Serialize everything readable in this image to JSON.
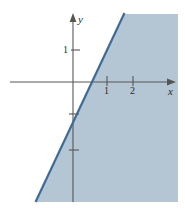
{
  "figure": {
    "name": "linear-inequality-graph",
    "background_color": "#ffffff",
    "shade_color": "#b4c6d4",
    "line_color": "#3c6c95",
    "axis_color": "#555555",
    "text_color": "#2b2b2b"
  },
  "axes": {
    "x_axis_label": "x",
    "y_axis_label": "y",
    "x_ticks": [
      {
        "label": "1",
        "value": 1
      },
      {
        "label": "2",
        "value": 2
      }
    ],
    "y_ticks": [
      {
        "label": "1",
        "value": 1
      },
      {
        "label": "",
        "value": -1
      },
      {
        "label": "",
        "value": -2
      }
    ],
    "origin_px": {
      "x": 73,
      "y": 82
    },
    "x_unit_px": 26,
    "y_unit_px": 32,
    "x_range": [
      -2.4,
      3.9
    ],
    "y_range": [
      -3.8,
      2.1
    ]
  },
  "chart_data": {
    "type": "line",
    "title": "",
    "xlabel": "x",
    "ylabel": "y",
    "xlim": [
      -2.4,
      3.9
    ],
    "ylim": [
      -3.8,
      2.1
    ],
    "grid": false,
    "legend": "none",
    "boundary_line": {
      "name": "solid-boundary-line",
      "style": "solid",
      "slope": 2.6,
      "intercept": -1.15,
      "x_intercept": 0.44,
      "y_intercept": -1.15,
      "endpoints_px": [
        {
          "x": 124,
          "y": 14
        },
        {
          "x": 36,
          "y": 201
        }
      ]
    },
    "shaded_region": {
      "name": "solution-region",
      "description": "region to the right of / below the boundary line is shaded",
      "side": "right",
      "fill": "#b4c6d4",
      "polygon_px": [
        {
          "x": 124,
          "y": 14
        },
        {
          "x": 178,
          "y": 14
        },
        {
          "x": 178,
          "y": 202
        },
        {
          "x": 36,
          "y": 202
        }
      ]
    }
  }
}
